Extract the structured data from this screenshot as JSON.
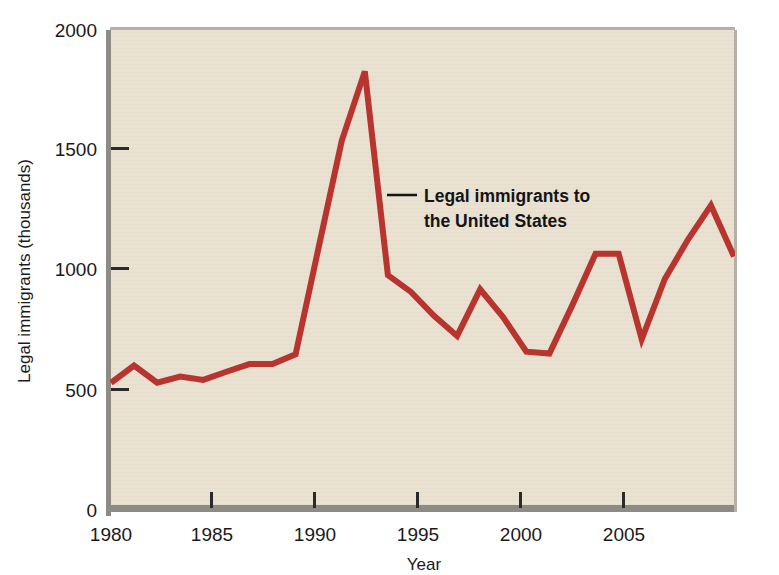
{
  "chart_data": {
    "type": "line",
    "title": "",
    "subtitle": "",
    "xlabel": "Year",
    "ylabel": "Legal immigrants (thousands)",
    "xlim": [
      1980,
      2007
    ],
    "ylim": [
      0,
      2000
    ],
    "yticks": [
      0,
      500,
      1000,
      1500,
      2000
    ],
    "ytick_labels": [
      "0",
      "500",
      "1000",
      "1500",
      "2000"
    ],
    "xticks": [
      1980,
      1985,
      1990,
      1995,
      2000,
      2005
    ],
    "xtick_labels": [
      "1980",
      "1985",
      "1990",
      "1995",
      "2000",
      "2005"
    ],
    "grid": false,
    "legend_position": "inline-annotation",
    "annotations": [
      {
        "text_line_1": "Legal immigrants to",
        "text_line_2": "the United States",
        "target_x": 1991.5,
        "target_y": 1240,
        "style": "bold-with-leader-line"
      }
    ],
    "series": [
      {
        "name": "Legal immigrants to the United States",
        "color": "#b8342e",
        "line_width": 6,
        "x": [
          1980,
          1981,
          1982,
          1983,
          1984,
          1985,
          1986,
          1987,
          1988,
          1989,
          1990,
          1991,
          1992,
          1993,
          1994,
          1995,
          1996,
          1997,
          1998,
          1999,
          2000,
          2001,
          2002,
          2003,
          2004,
          2005,
          2006,
          2007
        ],
        "values": [
          524,
          596,
          524,
          550,
          536,
          570,
          602,
          602,
          643,
          1091,
          1536,
          1827,
          974,
          904,
          804,
          720,
          915,
          798,
          654,
          646,
          850,
          1064,
          1064,
          706,
          958,
          1122,
          1266,
          1052
        ]
      }
    ],
    "colors": {
      "line": "#b8342e",
      "plot_background": "#e9e1d1",
      "axis_border": "#8d8b84",
      "text": "#1a1a1a",
      "page_background": "#ffffff"
    }
  },
  "figure": {
    "plot_area_label": "plot-area",
    "units_note": ""
  }
}
